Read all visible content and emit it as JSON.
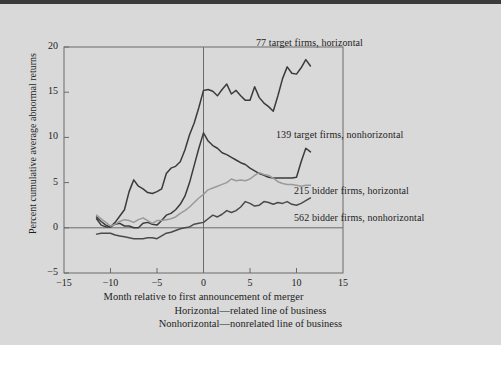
{
  "figure": {
    "background_color": "#d9d9d9",
    "frame_color": "#6b6b6b"
  },
  "axes": {
    "y_label": "Percent cumulative average abnormal returns",
    "y_ticks": [
      -5,
      0,
      5,
      10,
      15,
      20
    ],
    "y_tick_labels": [
      "−5",
      "0",
      "5",
      "10",
      "15",
      "20"
    ],
    "y_min": -5,
    "y_max": 20,
    "x_label": "Month relative to first announcement of merger",
    "x_ticks": [
      -15,
      -10,
      -5,
      0,
      5,
      10,
      15
    ],
    "x_tick_labels": [
      "−15",
      "−10",
      "−5",
      "0",
      "5",
      "10",
      "15"
    ],
    "x_min": -15,
    "x_max": 15
  },
  "notes": {
    "line1": "Horizontal—related line of business",
    "line2": "Nonhorizontal—nonrelated line of business"
  },
  "series_labels": {
    "target_horizontal": "77 target firms, horizontal",
    "target_nonhorizontal": "139 target firms, nonhorizontal",
    "bidder_horizontal": "215 bidder firms, horizontal",
    "bidder_nonhorizontal": "562 bidder firms, nonhorizontal"
  },
  "chart_data": {
    "type": "line",
    "title": "",
    "xlabel": "Month relative to first announcement of merger",
    "ylabel": "Percent cumulative average abnormal returns",
    "xlim": [
      -15,
      15
    ],
    "ylim": [
      -5,
      20
    ],
    "grid": false,
    "legend_position": "inline-right-of-curves",
    "annotations": [
      "Horizontal—related line of business",
      "Nonhorizontal—nonrelated line of business"
    ],
    "reference_lines": [
      {
        "axis": "y",
        "value": 0
      },
      {
        "axis": "x",
        "value": 0
      }
    ],
    "series": [
      {
        "name": "77 target firms, horizontal",
        "color": "#3b3b3b",
        "width": 1.5,
        "x": [
          -11.5,
          -11,
          -10.5,
          -10,
          -9.5,
          -9,
          -8.5,
          -8,
          -7.5,
          -7,
          -6.5,
          -6,
          -5.5,
          -5,
          -4.5,
          -4,
          -3.5,
          -3,
          -2.5,
          -2,
          -1.5,
          -1,
          -0.5,
          0,
          0.5,
          1,
          1.5,
          2,
          2.5,
          3,
          3.5,
          4,
          4.5,
          5,
          5.5,
          6,
          6.5,
          7,
          7.5,
          8,
          8.5,
          9,
          9.5,
          10,
          10.5,
          11,
          11.5
        ],
        "y": [
          1.0,
          0.3,
          0.1,
          0.1,
          0.6,
          1.3,
          2.0,
          4.0,
          5.3,
          4.6,
          4.3,
          3.9,
          3.8,
          4.0,
          4.3,
          6.0,
          6.6,
          6.8,
          7.3,
          8.6,
          10.3,
          11.6,
          13.3,
          15.2,
          15.3,
          15.1,
          14.6,
          15.3,
          15.9,
          14.8,
          15.2,
          14.6,
          14.1,
          14.1,
          15.6,
          14.4,
          13.8,
          13.4,
          12.9,
          14.6,
          16.5,
          17.8,
          17.1,
          17.0,
          17.7,
          18.6,
          17.9
        ]
      },
      {
        "name": "139 target firms, nonhorizontal",
        "color": "#3b3b3b",
        "width": 1.5,
        "x": [
          -11.5,
          -11,
          -10.5,
          -10,
          -9.5,
          -9,
          -8.5,
          -8,
          -7.5,
          -7,
          -6.5,
          -6,
          -5.5,
          -5,
          -4.5,
          -4,
          -3.5,
          -3,
          -2.5,
          -2,
          -1.5,
          -1,
          -0.5,
          0,
          0.5,
          1,
          1.5,
          2,
          2.5,
          3,
          3.5,
          4,
          4.5,
          5,
          5.5,
          6,
          6.5,
          7,
          7.5,
          8,
          8.5,
          9,
          9.5,
          10,
          10.5,
          11,
          11.5
        ],
        "y": [
          1.2,
          0.7,
          0.3,
          0.1,
          0.4,
          0.5,
          0.2,
          0.2,
          0.0,
          0.0,
          0.5,
          0.6,
          0.4,
          0.3,
          0.8,
          1.4,
          1.6,
          2.0,
          2.6,
          3.5,
          5.0,
          6.9,
          8.8,
          10.5,
          9.6,
          9.1,
          8.8,
          8.3,
          8.1,
          7.8,
          7.5,
          7.2,
          7.0,
          6.6,
          6.3,
          6.0,
          5.8,
          5.6,
          5.5,
          5.5,
          5.5,
          5.5,
          5.5,
          5.6,
          7.3,
          8.8,
          8.4
        ]
      },
      {
        "name": "215 bidder firms, horizontal",
        "color": "#9a9a9a",
        "width": 1.5,
        "x": [
          -11.5,
          -11,
          -10.5,
          -10,
          -9.5,
          -9,
          -8.5,
          -8,
          -7.5,
          -7,
          -6.5,
          -6,
          -5.5,
          -5,
          -4.5,
          -4,
          -3.5,
          -3,
          -2.5,
          -2,
          -1.5,
          -1,
          -0.5,
          0,
          0.5,
          1,
          1.5,
          2,
          2.5,
          3,
          3.5,
          4,
          4.5,
          5,
          5.5,
          6,
          6.5,
          7,
          7.5,
          8,
          8.5,
          9,
          9.5,
          10,
          10.5,
          11,
          11.5
        ],
        "y": [
          1.4,
          1.0,
          0.6,
          0.2,
          0.4,
          0.7,
          0.9,
          0.8,
          0.6,
          0.9,
          1.1,
          0.8,
          0.5,
          0.8,
          0.8,
          0.9,
          1.0,
          1.2,
          1.6,
          1.9,
          2.3,
          2.8,
          3.3,
          3.7,
          4.2,
          4.4,
          4.6,
          4.8,
          5.0,
          5.4,
          5.2,
          5.3,
          5.2,
          5.4,
          5.8,
          6.1,
          5.9,
          5.8,
          5.5,
          5.1,
          4.9,
          4.8,
          4.8,
          4.7,
          4.6,
          4.7,
          4.7
        ]
      },
      {
        "name": "562 bidder firms, nonhorizontal",
        "color": "#4a4a4a",
        "width": 1.5,
        "x": [
          -11.5,
          -11,
          -10.5,
          -10,
          -9.5,
          -9,
          -8.5,
          -8,
          -7.5,
          -7,
          -6.5,
          -6,
          -5.5,
          -5,
          -4.5,
          -4,
          -3.5,
          -3,
          -2.5,
          -2,
          -1.5,
          -1,
          -0.5,
          0,
          0.5,
          1,
          1.5,
          2,
          2.5,
          3,
          3.5,
          4,
          4.5,
          5,
          5.5,
          6,
          6.5,
          7,
          7.5,
          8,
          8.5,
          9,
          9.5,
          10,
          10.5,
          11,
          11.5
        ],
        "y": [
          -0.7,
          -0.6,
          -0.6,
          -0.6,
          -0.8,
          -0.9,
          -1.0,
          -1.1,
          -1.2,
          -1.2,
          -1.2,
          -1.1,
          -1.1,
          -1.2,
          -0.9,
          -0.6,
          -0.5,
          -0.3,
          -0.1,
          0.0,
          0.1,
          0.4,
          0.5,
          0.6,
          1.0,
          1.4,
          1.2,
          1.5,
          1.9,
          1.7,
          1.9,
          2.3,
          2.9,
          2.7,
          2.4,
          2.5,
          2.9,
          2.8,
          2.6,
          2.8,
          2.7,
          2.9,
          2.6,
          2.5,
          2.7,
          3.0,
          3.3
        ]
      }
    ]
  }
}
